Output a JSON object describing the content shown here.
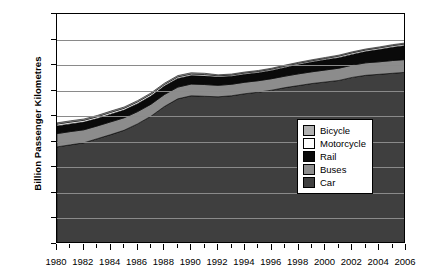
{
  "chart_data": {
    "type": "area",
    "stacked": true,
    "title": "",
    "xlabel": "",
    "ylabel": "Billion Passenger Kilometres",
    "xlim": [
      1980,
      2006
    ],
    "ylim": [
      0,
      900
    ],
    "ytick_step": 100,
    "yticks": [
      0,
      100,
      200,
      300,
      400,
      500,
      600,
      700,
      800,
      900
    ],
    "x": [
      1980,
      1981,
      1982,
      1983,
      1984,
      1985,
      1986,
      1987,
      1988,
      1989,
      1990,
      1991,
      1992,
      1993,
      1994,
      1995,
      1996,
      1997,
      1998,
      1999,
      2000,
      2001,
      2002,
      2003,
      2004,
      2005,
      2006
    ],
    "xtick_labels": [
      "1980",
      "1982",
      "1984",
      "1986",
      "1988",
      "1990",
      "1992",
      "1994",
      "1996",
      "1998",
      "2000",
      "2002",
      "2004",
      "2006"
    ],
    "grid": true,
    "legend_position": "center-right",
    "stack_order_bottom_to_top": [
      "Car",
      "Buses",
      "Rail",
      "Motorcycle",
      "Bicycle"
    ],
    "series": [
      {
        "name": "Car",
        "color": "#3f3f3f",
        "values": [
          380,
          388,
          396,
          412,
          428,
          445,
          470,
          500,
          538,
          568,
          580,
          578,
          576,
          580,
          588,
          594,
          602,
          612,
          620,
          628,
          634,
          640,
          652,
          660,
          664,
          668,
          672
        ]
      },
      {
        "name": "Buses",
        "color": "#8c8c8c",
        "values": [
          52,
          52,
          51,
          50,
          50,
          49,
          48,
          47,
          47,
          46,
          46,
          46,
          45,
          45,
          45,
          45,
          45,
          45,
          46,
          46,
          47,
          48,
          48,
          49,
          49,
          50,
          50
        ]
      },
      {
        "name": "Rail",
        "color": "#0a0a0a",
        "values": [
          30,
          30,
          30,
          29,
          30,
          30,
          31,
          32,
          33,
          34,
          33,
          33,
          32,
          31,
          31,
          31,
          32,
          34,
          36,
          38,
          40,
          41,
          42,
          44,
          48,
          52,
          55
        ]
      },
      {
        "name": "Motorcycle",
        "color": "#ffffff",
        "values": [
          7,
          7,
          7,
          7,
          7,
          7,
          7,
          7,
          6,
          6,
          6,
          6,
          5,
          5,
          5,
          5,
          5,
          5,
          5,
          5,
          5,
          6,
          6,
          6,
          6,
          6,
          6
        ]
      },
      {
        "name": "Bicycle",
        "color": "#b0b0b0",
        "values": [
          5,
          5,
          5,
          5,
          5,
          5,
          5,
          5,
          5,
          5,
          5,
          5,
          4,
          4,
          4,
          4,
          4,
          4,
          4,
          4,
          4,
          4,
          4,
          4,
          4,
          4,
          4
        ]
      }
    ],
    "legend": [
      {
        "label": "Bicycle",
        "color": "#b0b0b0"
      },
      {
        "label": "Motorcycle",
        "color": "#ffffff"
      },
      {
        "label": "Rail",
        "color": "#0a0a0a"
      },
      {
        "label": "Buses",
        "color": "#8c8c8c"
      },
      {
        "label": "Car",
        "color": "#3f3f3f"
      }
    ]
  }
}
